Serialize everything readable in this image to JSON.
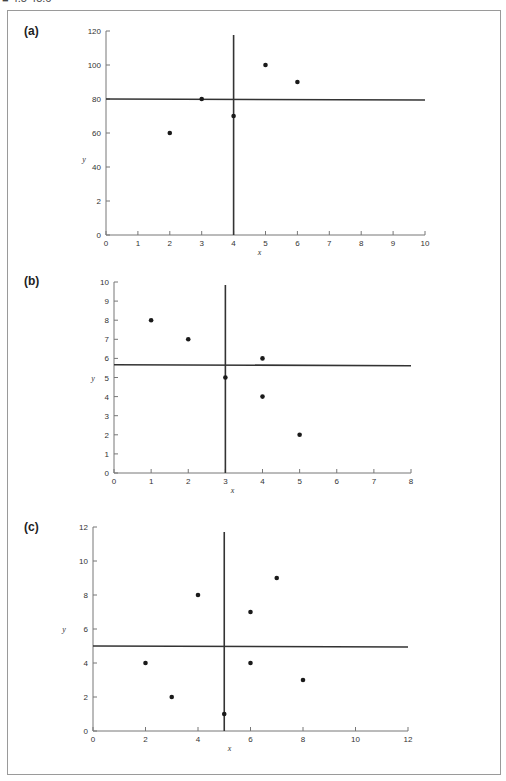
{
  "header": {
    "cut_text": "■ 4.5 45.6"
  },
  "panels": [
    {
      "label": "(a)"
    },
    {
      "label": "(b)"
    },
    {
      "label": "(c)"
    }
  ],
  "chart_data": [
    {
      "type": "scatter",
      "title": "(a)",
      "xlabel": "x",
      "ylabel": "y",
      "xlim": [
        0,
        10
      ],
      "ylim": [
        0,
        120
      ],
      "x_ticks": [
        "0",
        "1",
        "2",
        "3",
        "4",
        "5",
        "6",
        "7",
        "8",
        "9",
        "10"
      ],
      "y_ticks": [
        "0",
        "2",
        "40",
        "60",
        "80",
        "100",
        "120"
      ],
      "grid": false,
      "points": [
        [
          2,
          60
        ],
        [
          3,
          80
        ],
        [
          4,
          70
        ],
        [
          5,
          100
        ],
        [
          6,
          90
        ]
      ],
      "reference_lines": {
        "vertical_x": 4,
        "horizontal_y": 80
      }
    },
    {
      "type": "scatter",
      "title": "(b)",
      "xlabel": "x",
      "ylabel": "y",
      "xlim": [
        0,
        8
      ],
      "ylim": [
        0,
        10
      ],
      "x_ticks": [
        "0",
        "1",
        "2",
        "3",
        "4",
        "5",
        "6",
        "7",
        "8"
      ],
      "y_ticks": [
        "0",
        "1",
        "2",
        "3",
        "4",
        "5",
        "6",
        "7",
        "8",
        "9",
        "10"
      ],
      "grid": false,
      "points": [
        [
          1,
          8
        ],
        [
          2,
          7
        ],
        [
          3,
          5
        ],
        [
          4,
          6
        ],
        [
          4,
          4
        ],
        [
          5,
          2
        ]
      ],
      "reference_lines": {
        "vertical_x": 3,
        "horizontal_y": 5.67
      }
    },
    {
      "type": "scatter",
      "title": "(c)",
      "xlabel": "x",
      "ylabel": "y",
      "xlim": [
        0,
        12
      ],
      "ylim": [
        0,
        12
      ],
      "x_ticks": [
        "0",
        "2",
        "4",
        "6",
        "8",
        "10",
        "12"
      ],
      "y_ticks": [
        "0",
        "2",
        "4",
        "6",
        "8",
        "10",
        "12"
      ],
      "grid": false,
      "points": [
        [
          2,
          4
        ],
        [
          3,
          2
        ],
        [
          4,
          8
        ],
        [
          5,
          1
        ],
        [
          6,
          7
        ],
        [
          6,
          4
        ],
        [
          7,
          9
        ],
        [
          8,
          3
        ]
      ],
      "reference_lines": {
        "vertical_x": 5,
        "horizontal_y": 5
      }
    }
  ]
}
